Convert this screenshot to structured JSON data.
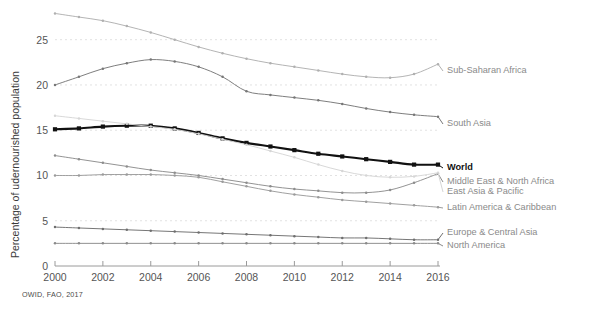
{
  "source_note": "OWID, FAO, 2017",
  "axes": {
    "ylabel": "Percentage of udernourished population",
    "xlabel": "",
    "yticks": [
      "0",
      "5",
      "10",
      "15",
      "20",
      "25"
    ],
    "xticks": [
      "2000",
      "2002",
      "2004",
      "2006",
      "2008",
      "2010",
      "2012",
      "2014",
      "2016"
    ]
  },
  "labels": {
    "sub_saharan_africa": "Sub-Saharan Africa",
    "south_asia": "South Asia",
    "world": "World",
    "middle_east_north_africa": "Middle East & North Africa",
    "east_asia_pacific": "East Asia & Pacific",
    "latin_america_caribbean": "Latin America & Caribbean",
    "europe_central_asia": "Europe & Central Asia",
    "north_america": "North America"
  },
  "colors": {
    "sub_saharan_africa": "#b0b0b0",
    "south_asia": "#777777",
    "world": "#111111",
    "middle_east_north_africa": "#8d8d8d",
    "east_asia_pacific": "#d6d6d6",
    "latin_america_caribbean": "#9b9b9b",
    "europe_central_asia": "#6f6f6f",
    "north_america": "#8a8a8a",
    "grid": "#e2e2e2",
    "axis": "#9a9a9a"
  },
  "chart_data": {
    "type": "line",
    "title": "",
    "xlabel": "",
    "ylabel": "Percentage of udernourished population",
    "xlim": [
      2000,
      2016
    ],
    "ylim": [
      0,
      28.5
    ],
    "yticks": [
      0,
      5,
      10,
      15,
      20,
      25
    ],
    "xticks": [
      2000,
      2002,
      2004,
      2006,
      2008,
      2010,
      2012,
      2014,
      2016
    ],
    "grid": true,
    "legend_position": "right-inline-labels",
    "x": [
      2000,
      2001,
      2002,
      2003,
      2004,
      2005,
      2006,
      2007,
      2008,
      2009,
      2010,
      2011,
      2012,
      2013,
      2014,
      2015,
      2016
    ],
    "series": [
      {
        "name": "Sub-Saharan Africa",
        "color": "#b0b0b0",
        "values": [
          27.9,
          27.5,
          27.1,
          26.5,
          25.8,
          25.0,
          24.2,
          23.5,
          22.9,
          22.4,
          22.0,
          21.6,
          21.2,
          20.9,
          20.8,
          21.2,
          22.3
        ]
      },
      {
        "name": "South Asia",
        "color": "#777777",
        "values": [
          20.0,
          20.9,
          21.8,
          22.4,
          22.8,
          22.6,
          22.0,
          20.9,
          19.3,
          18.9,
          18.6,
          18.3,
          17.9,
          17.4,
          17.0,
          16.7,
          16.5
        ]
      },
      {
        "name": "World",
        "color": "#111111",
        "values": [
          15.1,
          15.2,
          15.4,
          15.5,
          15.5,
          15.2,
          14.7,
          14.1,
          13.6,
          13.2,
          12.8,
          12.4,
          12.1,
          11.8,
          11.5,
          11.2,
          11.2
        ]
      },
      {
        "name": "Middle East & North Africa",
        "color": "#8d8d8d",
        "values": [
          12.2,
          11.8,
          11.4,
          11.0,
          10.6,
          10.3,
          10.0,
          9.6,
          9.2,
          8.8,
          8.5,
          8.3,
          8.1,
          8.1,
          8.4,
          9.2,
          10.2
        ]
      },
      {
        "name": "East Asia & Pacific",
        "color": "#d6d6d6",
        "values": [
          16.6,
          16.3,
          16.0,
          15.7,
          15.4,
          15.1,
          14.6,
          14.0,
          13.4,
          12.7,
          12.0,
          11.2,
          10.5,
          10.0,
          9.8,
          9.9,
          10.3
        ]
      },
      {
        "name": "Latin America & Caribbean",
        "color": "#9b9b9b",
        "values": [
          10.0,
          10.0,
          10.1,
          10.1,
          10.1,
          10.0,
          9.8,
          9.3,
          8.8,
          8.3,
          7.9,
          7.6,
          7.3,
          7.1,
          6.9,
          6.7,
          6.5
        ]
      },
      {
        "name": "Europe & Central Asia",
        "color": "#6f6f6f",
        "values": [
          4.3,
          4.2,
          4.1,
          4.0,
          3.9,
          3.8,
          3.7,
          3.6,
          3.5,
          3.4,
          3.3,
          3.2,
          3.1,
          3.1,
          3.0,
          2.9,
          2.9
        ]
      },
      {
        "name": "North America",
        "color": "#8a8a8a",
        "values": [
          2.5,
          2.5,
          2.5,
          2.5,
          2.5,
          2.5,
          2.5,
          2.5,
          2.5,
          2.5,
          2.5,
          2.5,
          2.5,
          2.5,
          2.5,
          2.5,
          2.5
        ]
      }
    ]
  },
  "series_label_anchors": {
    "sub_saharan_africa": {
      "y": 71
    },
    "south_asia": {
      "y": 124
    },
    "world": {
      "y": 168
    },
    "middle_east_north_africa": {
      "y": 182
    },
    "east_asia_pacific": {
      "y": 192
    },
    "latin_america_caribbean": {
      "y": 208
    },
    "europe_central_asia": {
      "y": 233
    },
    "north_america": {
      "y": 246
    }
  }
}
